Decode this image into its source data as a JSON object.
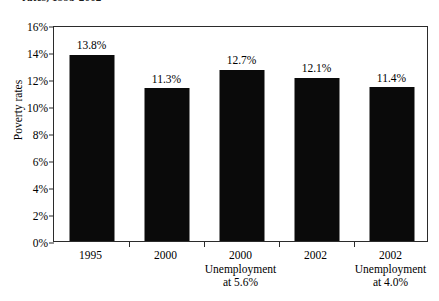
{
  "figure": {
    "title_cropped": "rates, 1995-2002",
    "background_color": "#ffffff",
    "bar_color": "#0a0a0a",
    "axis_color": "#2b2b2b"
  },
  "chart_data": {
    "type": "bar",
    "title": "",
    "xlabel": "",
    "ylabel": "Poverty rates",
    "categories": [
      "1995",
      "2000",
      "2000 Unemployment at 5.6%",
      "2002",
      "2002 Unemployment at 4.0%"
    ],
    "category_lines": [
      [
        "1995",
        "",
        ""
      ],
      [
        "2000",
        "",
        ""
      ],
      [
        "2000",
        "Unemployment",
        "at 5.6%"
      ],
      [
        "2002",
        "",
        ""
      ],
      [
        "2002",
        "Unemployment",
        "at 4.0%"
      ]
    ],
    "values": [
      13.8,
      11.3,
      12.7,
      12.1,
      11.4
    ],
    "value_labels": [
      "13.8%",
      "11.3%",
      "12.7%",
      "12.1%",
      "11.4%"
    ],
    "ylim": [
      0,
      16
    ],
    "ytick_values": [
      0,
      2,
      4,
      6,
      8,
      10,
      12,
      14,
      16
    ],
    "ytick_labels": [
      "0%",
      "2%",
      "4%",
      "6%",
      "8%",
      "10%",
      "12%",
      "14%",
      "16%"
    ],
    "grid": false,
    "legend": false,
    "legend_position": "none"
  }
}
